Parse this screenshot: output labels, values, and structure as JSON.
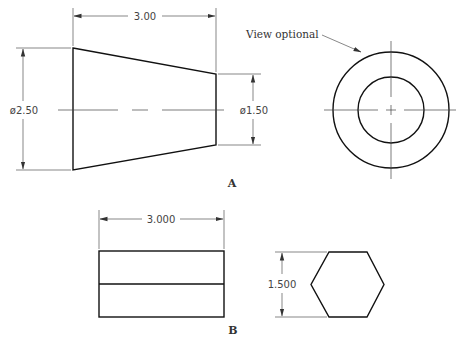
{
  "figure_a": {
    "label": "A",
    "side_view": {
      "length_dim": "3.00",
      "large_diameter_dim": "ø2.50",
      "small_diameter_dim": "ø1.50"
    },
    "end_view": {
      "note": "View optional"
    }
  },
  "figure_b": {
    "label": "B",
    "front_view": {
      "length_dim": "3.000"
    },
    "end_view": {
      "height_dim": "1.500",
      "shape": "hexagon"
    }
  }
}
